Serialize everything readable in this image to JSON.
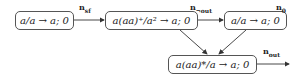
{
  "diagram": {
    "nodes": [
      {
        "id": "n1",
        "text": "a/a → a; 0",
        "label": "n",
        "label_sub": "sf"
      },
      {
        "id": "n2",
        "text": "a(aa)⁺/a² → a; 0",
        "label": "n",
        "label_sub": "¬out"
      },
      {
        "id": "n3",
        "text": "a/a → a; 0",
        "label": "n",
        "label_sub": "0"
      },
      {
        "id": "n4",
        "text": "a(aa)*/a → a; 0",
        "label": "n",
        "label_sub": "out"
      }
    ],
    "edges": [
      {
        "from": "n1",
        "to": "n2"
      },
      {
        "from": "n2",
        "to": "n3"
      },
      {
        "from": "n2",
        "to": "n4"
      },
      {
        "from": "n3",
        "to": "n4"
      },
      {
        "from": "n4",
        "to": "output"
      }
    ]
  }
}
